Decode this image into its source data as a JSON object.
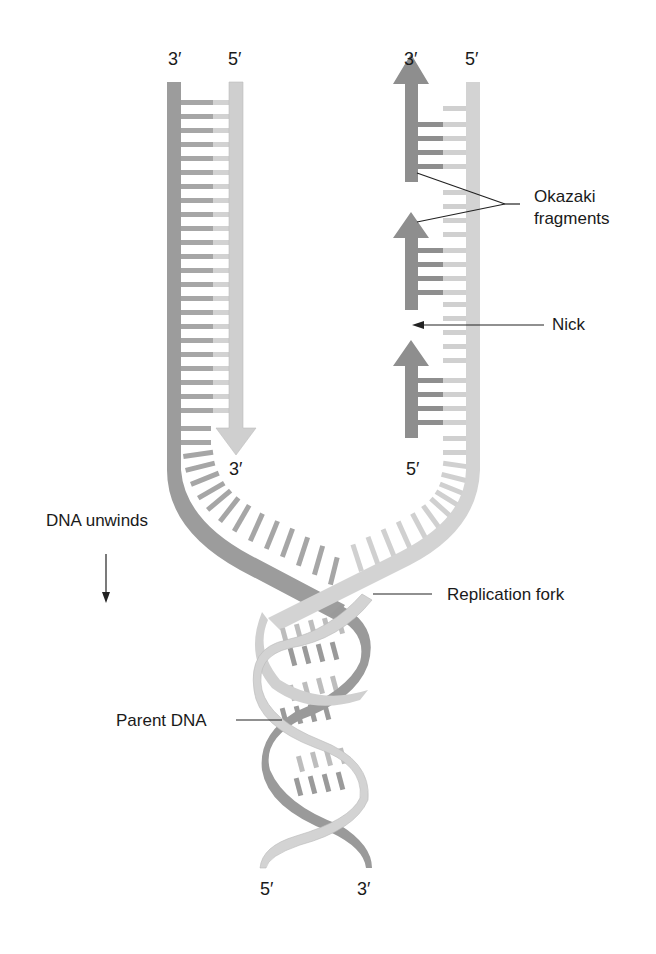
{
  "figure": {
    "colors": {
      "dark_strand": "#9a9a9a",
      "light_strand": "#cfcfcf",
      "fragment": "#8c8c8c",
      "background": "#ffffff",
      "text": "#1a1a1a"
    },
    "end_labels": {
      "left_top_3": "3′",
      "left_top_5": "5′",
      "right_top_3": "3′",
      "right_top_5": "5′",
      "leading_arrow_3": "3′",
      "lagging_bottom_5": "5′",
      "bottom_5": "5′",
      "bottom_3": "3′"
    },
    "annotations": {
      "okazaki": [
        "Okazaki",
        "fragments"
      ],
      "nick": "Nick",
      "dna_unwinds": "DNA unwinds",
      "replication_fork": "Replication fork",
      "parent_dna": "Parent DNA"
    }
  }
}
